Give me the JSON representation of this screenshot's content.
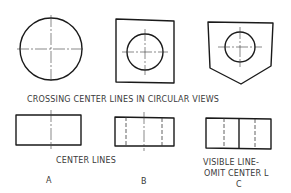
{
  "diagram": {
    "caption_top": "CROSSING CENTER LINES IN CIRCULAR VIEWS",
    "caption_center_lines": "CENTER LINES",
    "caption_visible_line_1": "VISIBLE LINE-",
    "caption_visible_line_2": "OMIT CENTER L",
    "views": [
      {
        "id": "A",
        "label": "A",
        "circular_view": "circle with crossing center lines",
        "side_view": "rectangle with single center line"
      },
      {
        "id": "B",
        "label": "B",
        "circular_view": "square with hole and crossing center lines",
        "side_view": "rectangle with center line and two hidden lines"
      },
      {
        "id": "C",
        "label": "C",
        "circular_view": "pentagon with hole and crossing center lines",
        "side_view": "rectangle with visible line, center line omitted, two hidden lines"
      }
    ]
  }
}
